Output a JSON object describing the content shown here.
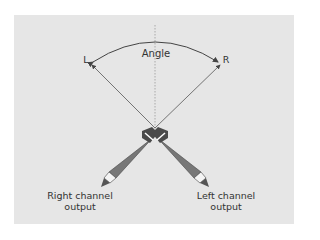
{
  "diagram": {
    "angle_label": "Angle",
    "left_label": "L",
    "right_label": "R",
    "right_output_line1": "Right channel",
    "right_output_line2": "output",
    "left_output_line1": "Left channel",
    "left_output_line2": "output"
  },
  "colors": {
    "background": "#e6e6e6",
    "mic_body": "#6e6e6e",
    "mic_head": "#4a4a4a",
    "arrow": "#444444"
  }
}
